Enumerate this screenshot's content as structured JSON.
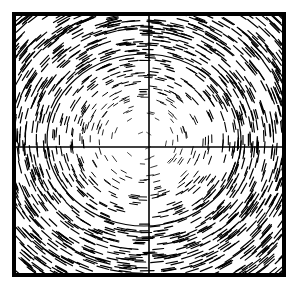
{
  "figure": {
    "title_visible_fragment": "",
    "frame": {
      "x": 14,
      "y": 14,
      "width": 270,
      "height": 261,
      "stroke": "#000000",
      "stroke_width": 4
    },
    "crosshair": {
      "x": 149,
      "y": 147,
      "stroke": "#000000",
      "stroke_width": 1.6
    },
    "contour": {
      "cx": 144,
      "cy": 140,
      "rx": 97,
      "ry": 86,
      "stroke": "#000000",
      "stroke_width": 1.2,
      "description": "closed elliptical streamline around center vortex"
    },
    "vector_field": {
      "type": "rotational vortex (LIC-style short dashes)",
      "center": {
        "x": 144,
        "y": 140
      },
      "rotation": "clockwise",
      "density_low_center": true,
      "dash_color": "#000000",
      "dash_count": 1400,
      "seed": 7
    }
  }
}
